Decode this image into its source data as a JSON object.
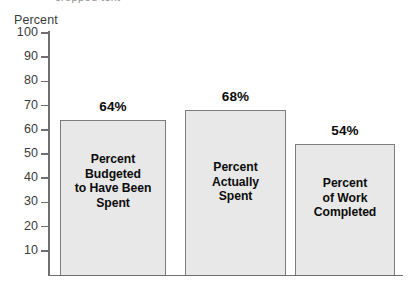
{
  "chart_data": {
    "type": "bar",
    "title": "",
    "subtitle": "",
    "xlabel": "",
    "ylabel": "Percent",
    "ylim": [
      0,
      100
    ],
    "ytick_step": 10,
    "ytick_labels": [
      "100",
      "90",
      "80",
      "70",
      "60",
      "50",
      "40",
      "30",
      "20",
      "10"
    ],
    "ytick_values": [
      100,
      90,
      80,
      70,
      60,
      50,
      40,
      30,
      20,
      10
    ],
    "grid": false,
    "legend": null,
    "legend_position": "none",
    "categories": [
      "Percent Budgeted to Have Been Spent",
      "Percent Actually Spent",
      "Percent of Work Completed"
    ],
    "values": [
      64,
      68,
      54
    ],
    "value_labels": [
      "64%",
      "68%",
      "54%"
    ],
    "bars": [
      {
        "value": 64,
        "value_label": "64%",
        "label_lines": [
          "Percent",
          "Budgeted",
          "to Have Been",
          "Spent"
        ]
      },
      {
        "value": 68,
        "value_label": "68%",
        "label_lines": [
          "Percent",
          "Actually",
          "Spent"
        ]
      },
      {
        "value": 54,
        "value_label": "54%",
        "label_lines": [
          "Percent",
          "of Work",
          "Completed"
        ]
      }
    ],
    "colors": {
      "bar_fill": "#e8e8e8",
      "bar_border": "#7d7d81",
      "axis": "#6f6f73",
      "text": "#0c0c0c",
      "axis_text": "#3b3b3d",
      "background": "#ffffff"
    }
  },
  "artifact": {
    "top_sliver": "cropped text"
  }
}
